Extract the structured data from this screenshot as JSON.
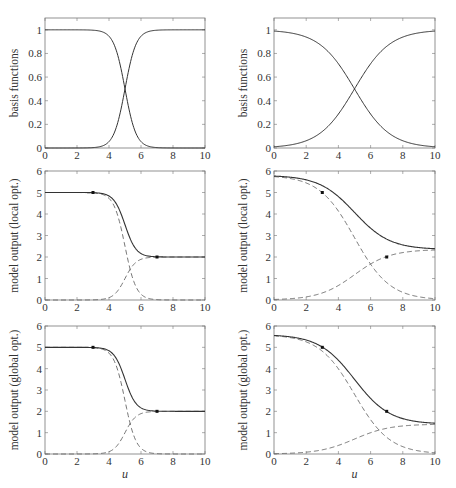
{
  "chart_data": [
    {
      "type": "line",
      "panel": "top-left",
      "ylabel": "basis functions",
      "xlabel": "",
      "xlim": [
        0,
        10
      ],
      "ylim": [
        0,
        1.1
      ],
      "xticks": [
        "0",
        "2",
        "4",
        "6",
        "8",
        "10"
      ],
      "yticks": [
        "0",
        "0.2",
        "0.4",
        "0.6",
        "0.8",
        "1"
      ],
      "series": [
        {
          "name": "basis 1",
          "style": "solid",
          "center": 5,
          "width": 0.35,
          "direction": "decreasing"
        },
        {
          "name": "basis 2",
          "style": "solid",
          "center": 5,
          "width": 0.35,
          "direction": "increasing"
        }
      ]
    },
    {
      "type": "line",
      "panel": "top-right",
      "ylabel": "basis functions",
      "xlabel": "",
      "xlim": [
        0,
        10
      ],
      "ylim": [
        0,
        1.1
      ],
      "xticks": [
        "0",
        "2",
        "4",
        "6",
        "8",
        "10"
      ],
      "yticks": [
        "0",
        "0.2",
        "0.4",
        "0.6",
        "0.8",
        "1"
      ],
      "series": [
        {
          "name": "basis 1",
          "style": "solid",
          "center": 5,
          "width": 1.1,
          "direction": "decreasing"
        },
        {
          "name": "basis 2",
          "style": "solid",
          "center": 5,
          "width": 1.1,
          "direction": "increasing"
        }
      ]
    },
    {
      "type": "line",
      "panel": "middle-left",
      "ylabel": "model output  (local opt.)",
      "xlabel": "",
      "xlim": [
        0,
        10
      ],
      "ylim": [
        0,
        6
      ],
      "xticks": [
        "0",
        "2",
        "4",
        "6",
        "8",
        "10"
      ],
      "yticks": [
        "0",
        "1",
        "2",
        "3",
        "4",
        "5",
        "6"
      ],
      "width": 0.35,
      "local_models": [
        {
          "value": 5
        },
        {
          "value": 2
        }
      ],
      "points": [
        {
          "x": 3,
          "y": 5
        },
        {
          "x": 7,
          "y": 2
        }
      ]
    },
    {
      "type": "line",
      "panel": "middle-right",
      "ylabel": "model output  (local opt.)",
      "xlabel": "",
      "xlim": [
        0,
        10
      ],
      "ylim": [
        0,
        6
      ],
      "xticks": [
        "0",
        "2",
        "4",
        "6",
        "8",
        "10"
      ],
      "yticks": [
        "0",
        "1",
        "2",
        "3",
        "4",
        "5",
        "6"
      ],
      "width": 1.1,
      "local_models": [
        {
          "value": 5.8
        },
        {
          "value": 2.35
        }
      ],
      "points": [
        {
          "x": 3,
          "y": 5
        },
        {
          "x": 7,
          "y": 2
        }
      ]
    },
    {
      "type": "line",
      "panel": "bottom-left",
      "ylabel": "model output  (global opt.)",
      "xlabel": "u",
      "xlim": [
        0,
        10
      ],
      "ylim": [
        0,
        6
      ],
      "xticks": [
        "0",
        "2",
        "4",
        "6",
        "8",
        "10"
      ],
      "yticks": [
        "0",
        "1",
        "2",
        "3",
        "4",
        "5",
        "6"
      ],
      "width": 0.35,
      "local_models": [
        {
          "value": 5
        },
        {
          "value": 2
        }
      ],
      "points": [
        {
          "x": 3,
          "y": 5
        },
        {
          "x": 7,
          "y": 2
        }
      ]
    },
    {
      "type": "line",
      "panel": "bottom-right",
      "ylabel": "model output  (global opt.)",
      "xlabel": "u",
      "xlim": [
        0,
        10
      ],
      "ylim": [
        0,
        6
      ],
      "xticks": [
        "0",
        "2",
        "4",
        "6",
        "8",
        "10"
      ],
      "yticks": [
        "0",
        "1",
        "2",
        "3",
        "4",
        "5",
        "6"
      ],
      "width": 1.1,
      "local_models": [
        {
          "value": 5.6
        },
        {
          "value": 1.4
        }
      ],
      "points": [
        {
          "x": 3,
          "y": 5
        },
        {
          "x": 7,
          "y": 2
        }
      ]
    }
  ],
  "frames": [
    {
      "x0": 45,
      "x1": 205,
      "y0": 18,
      "y1": 148
    },
    {
      "x0": 274,
      "x1": 435,
      "y0": 18,
      "y1": 148
    },
    {
      "x0": 45,
      "x1": 205,
      "y0": 171,
      "y1": 300
    },
    {
      "x0": 274,
      "x1": 435,
      "y0": 171,
      "y1": 300
    },
    {
      "x0": 45,
      "x1": 205,
      "y0": 326,
      "y1": 454
    },
    {
      "x0": 274,
      "x1": 435,
      "y0": 326,
      "y1": 454
    }
  ],
  "colors": {
    "line": "#333333",
    "frame": "#777777",
    "dashed": "#666666"
  }
}
